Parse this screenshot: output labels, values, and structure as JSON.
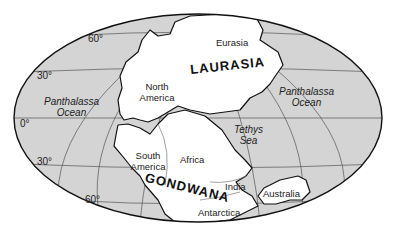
{
  "map": {
    "title": "Pangaea supercontinent",
    "colors": {
      "ocean": "#d4d4d4",
      "land": "#ffffff",
      "outline": "#111111",
      "grid": "#555555"
    },
    "latitude_labels": {
      "n60": "60°",
      "n30": "30°",
      "eq": "0°",
      "s30": "30°",
      "s60": "60°"
    },
    "supercontinents": {
      "laurasia": "LAURASIA",
      "gondwana": "GONDWANA"
    },
    "continents": {
      "eurasia": "Eurasia",
      "north_america": "North America",
      "south_america": "South America",
      "africa": "Africa",
      "india": "India",
      "australia": "Australia",
      "antarctica": "Antarctica"
    },
    "oceans": {
      "panthalassa_west_1": "Panthalassa",
      "panthalassa_west_2": "Ocean",
      "panthalassa_east_1": "Panthalassa",
      "panthalassa_east_2": "Ocean",
      "tethys_1": "Tethys",
      "tethys_2": "Sea"
    }
  }
}
